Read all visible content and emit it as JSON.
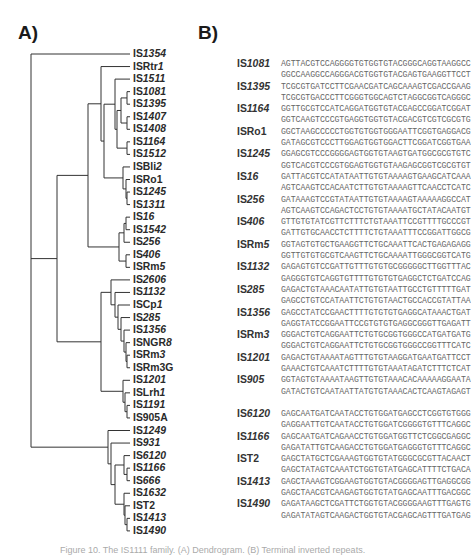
{
  "panels": {
    "a_label": "A)",
    "b_label": "B)"
  },
  "tree": {
    "leaves": [
      {
        "prefix": "IS",
        "suffix": "1354",
        "italic": true
      },
      {
        "prefix": "ISRtr",
        "suffix": "1",
        "italic": true
      },
      {
        "prefix": "IS",
        "suffix": "1511",
        "italic": true
      },
      {
        "prefix": "IS",
        "suffix": "1081",
        "italic": true
      },
      {
        "prefix": "IS",
        "suffix": "1395",
        "italic": true
      },
      {
        "prefix": "IS",
        "suffix": "1407",
        "italic": true
      },
      {
        "prefix": "IS",
        "suffix": "1408",
        "italic": true
      },
      {
        "prefix": "IS",
        "suffix": "1164",
        "italic": true
      },
      {
        "prefix": "IS",
        "suffix": "1512",
        "italic": true
      },
      {
        "prefix": "ISBli",
        "suffix": "2",
        "italic": true
      },
      {
        "prefix": "ISRo1",
        "suffix": "",
        "italic": false
      },
      {
        "prefix": "IS",
        "suffix": "1245",
        "italic": true
      },
      {
        "prefix": "IS",
        "suffix": "1311",
        "italic": true
      },
      {
        "prefix": "IS",
        "suffix": "16",
        "italic": true
      },
      {
        "prefix": "IS",
        "suffix": "1542",
        "italic": true
      },
      {
        "prefix": "IS",
        "suffix": "256",
        "italic": true
      },
      {
        "prefix": "IS",
        "suffix": "406",
        "italic": true
      },
      {
        "prefix": "ISRm",
        "suffix": "5",
        "italic": true
      },
      {
        "prefix": "IS",
        "suffix": "2606",
        "italic": true
      },
      {
        "prefix": "IS",
        "suffix": "1132",
        "italic": true
      },
      {
        "prefix": "ISCp",
        "suffix": "1",
        "italic": true
      },
      {
        "prefix": "IS",
        "suffix": "285",
        "italic": true
      },
      {
        "prefix": "IS",
        "suffix": "1356",
        "italic": true
      },
      {
        "prefix": "ISNGR",
        "suffix": "8",
        "italic": true
      },
      {
        "prefix": "ISRm",
        "suffix": "3",
        "italic": true
      },
      {
        "prefix": "ISRm3G",
        "suffix": "",
        "italic": false
      },
      {
        "prefix": "IS",
        "suffix": "1201",
        "italic": true
      },
      {
        "prefix": "ISLrh",
        "suffix": "1",
        "italic": true
      },
      {
        "prefix": "IS",
        "suffix": "1191",
        "italic": true
      },
      {
        "prefix": "IS905A",
        "suffix": "",
        "italic": false
      },
      {
        "prefix": "IS",
        "suffix": "1249",
        "italic": true
      },
      {
        "prefix": "IS",
        "suffix": "931",
        "italic": true
      },
      {
        "prefix": "IS",
        "suffix": "6120",
        "italic": true
      },
      {
        "prefix": "IS",
        "suffix": "1166",
        "italic": true
      },
      {
        "prefix": "IS",
        "suffix": "666",
        "italic": true
      },
      {
        "prefix": "IS",
        "suffix": "1632",
        "italic": true
      },
      {
        "prefix": "IST2",
        "suffix": "",
        "italic": false
      },
      {
        "prefix": "IS",
        "suffix": "1413",
        "italic": true
      },
      {
        "prefix": "IS",
        "suffix": "1490",
        "italic": true
      }
    ]
  },
  "sequences": [
    {
      "prefix": "IS",
      "suffix": "1081",
      "lines": [
        "AGTTACGTCCAGGGGTGTGGTGTACGGGCAGGTAAGGCC",
        "GGCCAAGGCCAGGGACGTGGTGTACGAGTGAAGGTTCCT"
      ]
    },
    {
      "prefix": "IS",
      "suffix": "1395",
      "lines": [
        "TCGCGTGATCCTTCGAACGATCAGCAAAGTCGACCGAAG",
        "TCGCGTGACCCTTCGGGTGGCAGTCTAGGCGGTCAGGGC"
      ]
    },
    {
      "prefix": "IS",
      "suffix": "1164",
      "lines": [
        "GGTTGCGTCCATCAGGATGGTGTACGAGCCGGATCGGAT",
        "GGTCAAGTCCCGTGAGGTGGTGTACGACGTCGTCGCGTG"
      ]
    },
    {
      "prefix": "ISRo1",
      "suffix": "",
      "lines": [
        "GGCTAAGCCCCCTGGTGTGGTGGGAATTCGGTGAGGACG",
        "GATAGCGTCCCTTGGAGTGGTGGACTTCGGATCGGTGAA"
      ]
    },
    {
      "prefix": "IS",
      "suffix": "1245",
      "lines": [
        "GGAGCGTCCCGGGGAGTGGTGTAAGTGATGGCGCGTGTC",
        "GGTCACGTCCCGTGGAGTGGTGTAAGAGCGGTCGCGTGT"
      ]
    },
    {
      "prefix": "IS",
      "suffix": "16",
      "lines": [
        "GATTACGTCCATATAATTGTGTAAAAGTGAAGCATCAAA",
        "AGTCAAGTCCACAATCTTGTGTAAAAGTTCAACCTCATC"
      ]
    },
    {
      "prefix": "IS",
      "suffix": "256",
      "lines": [
        "GATAAAGTCCGTATAATTGTGTAAAAGTAAAAAGGCCAT",
        "AGTCAAGTCCAGACTCCTGTGTAAAATGCTATACAATGT"
      ]
    },
    {
      "prefix": "IS",
      "suffix": "406",
      "lines": [
        "GTTGTGTATCGTTCTTTCTGTAAATTCCGTTTTGCCCGT",
        "GATTGTGCAACCTCTTTTCTGTAAATTTCCGGATTGGCG"
      ]
    },
    {
      "prefix": "ISRm",
      "suffix": "5",
      "lines": [
        "GGTAGTGTGCTGAAGGTTCTGCAAATTCACTGAGAGAGG",
        "GGTTGTGTGCGTCAAGTTCTGCAAAATTGGGCGGTCATG"
      ]
    },
    {
      "prefix": "IS",
      "suffix": "1132",
      "lines": [
        "GAGAGTGTCCGATTGTTTGTGTGCGGGGGCTTGGTTTAC",
        "GAGGGTGTCAGGTGTTTTGTGTGTGAGGCTCTGATCCAG"
      ]
    },
    {
      "prefix": "IS",
      "suffix": "285",
      "lines": [
        "GAGACTGTAAACAATATTGTGTAATTGCCTGTTTTTGAT",
        "GAGCCTGTCCATAATTCTGTGTAACTGCCACCGTATTAA"
      ]
    },
    {
      "prefix": "IS",
      "suffix": "1356",
      "lines": [
        "GAGCCTATCCGAACTTTTGTGTGTGAGGCATAAACTGAT",
        "GAGGTATCCGGAATTCCGTGTGTGAGGCGGGTTGAGATT"
      ]
    },
    {
      "prefix": "ISRm",
      "suffix": "3",
      "lines": [
        "GGGACTGTCAGGAATTCTGTGCGGTGGGCCATGATGATG",
        "GGGACTGTCAGGAATTCTGTGCGGTGGGCCGGTTTCATC"
      ]
    },
    {
      "prefix": "IS",
      "suffix": "1201",
      "lines": [
        "GAGACTGTAAAATAGTTTGTGTAAGGATGAATGATTCCT",
        "GAAACTGTCAAATCTTTTGTGTAAATAGATCTTTCTCAT"
      ]
    },
    {
      "prefix": "IS",
      "suffix": "905",
      "lines": [
        "GGTAGTGTAAAATAAGTTGTGTAAACACAAAAAGGAATA",
        "GATACTGTCAATAATTATGTGTAAACACTCAAGTAGAGT"
      ]
    },
    {
      "prefix": "IS",
      "suffix": "6120",
      "lines": [
        "GAGCAATGATCAATACCTGTGGATGAGCCTCGGTGTGGG",
        "GAGGAATTGTCAATACCTGTGGATCGGGGTGTTTCAGGC"
      ]
    },
    {
      "prefix": "IS",
      "suffix": "1166",
      "lines": [
        "GAGCAATGATCAGAACCTGTGGATGGTTCTCGGCGAGGC",
        "GAGATATTGTCAAGACCTGTGGATGAGGGTGTTTCAGGC"
      ]
    },
    {
      "prefix": "IST2",
      "suffix": "",
      "lines": [
        "GAGCTATGCTCGAAAGTGGTGTATGGGCGCGTTACAACT",
        "GAGCTATAGTCAAATCTGGTGTATGAGCATTTTCTGACA"
      ]
    },
    {
      "prefix": "IS",
      "suffix": "1413",
      "lines": [
        "GAGCTAAAGTCGGAAGTGGTGTACGGGGAGTTGAGGCGG",
        "GAGCTAACGTCAAGAGTGGTGTATGAGCAATTTGACGGC"
      ]
    },
    {
      "prefix": "IS",
      "suffix": "1490",
      "lines": [
        "GAGATAAGCTCGATTCTGGTGTACGGGGAAGTTTGAGTG",
        "GAGATATAGTCAAGACTGGTGTACGAGCAGTTTGATGAG"
      ]
    }
  ],
  "caption": "Figure 10. The IS1111 family. (A) Dendrogram. (B) Terminal inverted repeats."
}
